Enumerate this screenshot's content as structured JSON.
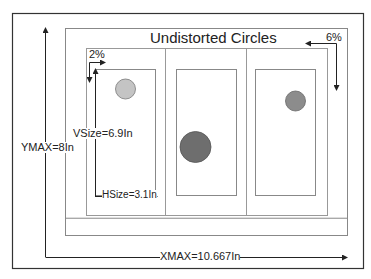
{
  "diagram": {
    "title": "Undistorted Circles",
    "labels": {
      "xmax": "XMAX=10.667In",
      "ymax": "YMAX=8In",
      "vsize": "VSize=6.9In",
      "hsize": "HSize=3.1In",
      "margin_left_pct": "2%",
      "margin_right_pct": "6%"
    },
    "columns": [
      {
        "name": "left",
        "circle_color": "#c4c4c4",
        "circle_size": "small"
      },
      {
        "name": "middle",
        "circle_color": "#6e6e6e",
        "circle_size": "large"
      },
      {
        "name": "right",
        "circle_color": "#8c8c8c",
        "circle_size": "small"
      }
    ],
    "colors": {
      "outer_frame": "#333333",
      "inner_frames": "#8a8a8a",
      "arrows": "#222222"
    }
  }
}
